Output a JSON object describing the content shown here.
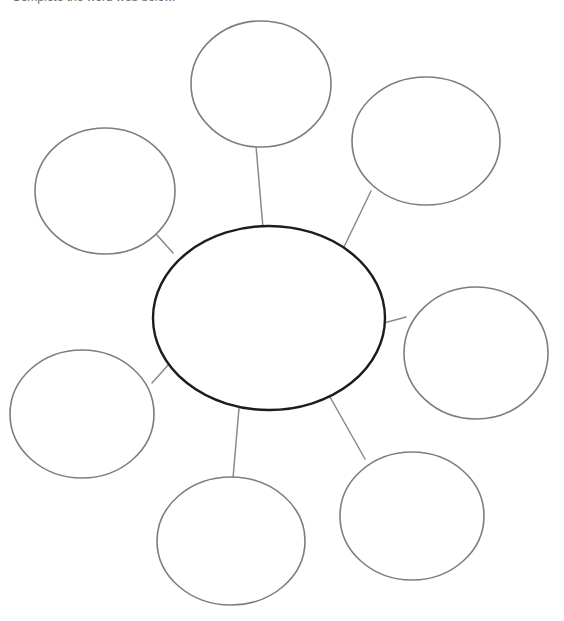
{
  "page": {
    "background_color": "#ffffff",
    "width": 564,
    "height": 621
  },
  "header": {
    "truncated_text": "Complete the word web below.",
    "note": "text clipped at top edge of viewport"
  },
  "diagram": {
    "type": "word-web",
    "center_node": {
      "name": "center-node",
      "label": "",
      "shape": "ellipse",
      "cx": 269,
      "cy": 318,
      "rx": 116,
      "ry": 92,
      "stroke_color": "#1c1c1c",
      "stroke_width": 2.4,
      "fill": "#ffffff"
    },
    "outer_nodes": [
      {
        "name": "node-top",
        "label": "",
        "shape": "ellipse",
        "cx": 261,
        "cy": 84,
        "rx": 70,
        "ry": 63,
        "stroke_color": "#7d7d7d",
        "stroke_width": 1.6,
        "fill": "#ffffff"
      },
      {
        "name": "node-top-right",
        "label": "",
        "shape": "ellipse",
        "cx": 426,
        "cy": 141,
        "rx": 74,
        "ry": 64,
        "stroke_color": "#7d7d7d",
        "stroke_width": 1.6,
        "fill": "#ffffff"
      },
      {
        "name": "node-right",
        "label": "",
        "shape": "ellipse",
        "cx": 476,
        "cy": 353,
        "rx": 72,
        "ry": 66,
        "stroke_color": "#7d7d7d",
        "stroke_width": 1.6,
        "fill": "#ffffff"
      },
      {
        "name": "node-bottom-right",
        "label": "",
        "shape": "ellipse",
        "cx": 412,
        "cy": 516,
        "rx": 72,
        "ry": 64,
        "stroke_color": "#7d7d7d",
        "stroke_width": 1.6,
        "fill": "#ffffff"
      },
      {
        "name": "node-bottom",
        "label": "",
        "shape": "ellipse",
        "cx": 231,
        "cy": 541,
        "rx": 74,
        "ry": 64,
        "stroke_color": "#7d7d7d",
        "stroke_width": 1.6,
        "fill": "#ffffff"
      },
      {
        "name": "node-bottom-left",
        "label": "",
        "shape": "ellipse",
        "cx": 82,
        "cy": 414,
        "rx": 72,
        "ry": 64,
        "stroke_color": "#7d7d7d",
        "stroke_width": 1.6,
        "fill": "#ffffff"
      },
      {
        "name": "node-top-left",
        "label": "",
        "shape": "ellipse",
        "cx": 105,
        "cy": 191,
        "rx": 70,
        "ry": 63,
        "stroke_color": "#7d7d7d",
        "stroke_width": 1.6,
        "fill": "#ffffff"
      }
    ],
    "connectors": [
      {
        "name": "connector-top",
        "x1": 256,
        "y1": 146,
        "x2": 263,
        "y2": 228,
        "stroke_color": "#8a8a8a",
        "stroke_width": 1.5
      },
      {
        "name": "connector-top-right",
        "x1": 371,
        "y1": 191,
        "x2": 343,
        "y2": 249,
        "stroke_color": "#8a8a8a",
        "stroke_width": 1.5
      },
      {
        "name": "connector-right",
        "x1": 385,
        "y1": 323,
        "x2": 405,
        "y2": 317,
        "stroke_color": "#8a8a8a",
        "stroke_width": 1.5
      },
      {
        "name": "connector-bottom-right",
        "x1": 330,
        "y1": 397,
        "x2": 365,
        "y2": 459,
        "stroke_color": "#8a8a8a",
        "stroke_width": 1.5
      },
      {
        "name": "connector-bottom",
        "x1": 239,
        "y1": 408,
        "x2": 233,
        "y2": 478,
        "stroke_color": "#8a8a8a",
        "stroke_width": 1.5
      },
      {
        "name": "connector-bottom-left",
        "x1": 169,
        "y1": 364,
        "x2": 153,
        "y2": 382,
        "stroke_color": "#8a8a8a",
        "stroke_width": 1.5
      },
      {
        "name": "connector-top-left",
        "x1": 157,
        "y1": 236,
        "x2": 172,
        "y2": 252,
        "stroke_color": "#8a8a8a",
        "stroke_width": 1.5
      }
    ]
  }
}
